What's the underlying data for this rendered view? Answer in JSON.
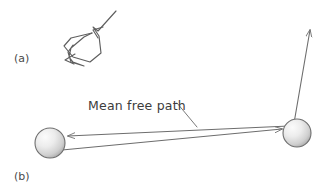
{
  "figure": {
    "background_color": "#ffffff",
    "line_color": "#6d6d6d",
    "text_color": "#3c3c3c",
    "sphere_fill_light": "#f2f2f2",
    "sphere_fill_dark": "#a8a8a8",
    "sphere_edge_color": "#6f6f6f",
    "width": 325,
    "height": 192
  },
  "panels": {
    "a": {
      "label": "(a)",
      "label_x": 14,
      "label_y": 62,
      "caption": "random zigzag molecular path"
    },
    "b": {
      "label": "(b)",
      "label_x": 14,
      "label_y": 180,
      "caption": "mean free path between two collisions"
    }
  },
  "annotations": {
    "mean_free_path": {
      "text": "Mean free path",
      "x": 88,
      "y": 110
    }
  },
  "spheres": [
    {
      "name": "left-molecule",
      "cx": 50,
      "cy": 143,
      "r": 15
    },
    {
      "name": "right-molecule",
      "cx": 297,
      "cy": 133,
      "r": 14
    }
  ],
  "arrows": {
    "left_pointing": {
      "name": "mean-free-path-arrow-left",
      "x1": 288,
      "y1": 126,
      "x2": 67,
      "y2": 136
    },
    "right_pointing": {
      "name": "mean-free-path-arrow-right",
      "x1": 62,
      "y1": 150,
      "x2": 283,
      "y2": 128
    },
    "escape": {
      "name": "post-collision-trajectory-arrow",
      "x1": 293,
      "y1": 128,
      "x2": 311,
      "y2": 27
    }
  },
  "leader": {
    "name": "mean-free-path-leader-line",
    "x1": 178,
    "y1": 104,
    "x2": 196,
    "y2": 126
  },
  "zigzag": {
    "name": "random-walk-path",
    "points": "116,11 98,31 93,27 99,36 101,53 90,62 73,57 64,46 71,38 92,33 96,33 84,37 71,48 69,57 73,62 84,66 71,62 68,52 73,45",
    "arrowheads": [
      {
        "name": "zigzag-arrowhead-upper",
        "tip_x": 93,
        "tip_y": 29,
        "angle": 225
      },
      {
        "name": "zigzag-arrowhead-lower",
        "tip_x": 66,
        "tip_y": 61,
        "angle": 215
      }
    ]
  }
}
